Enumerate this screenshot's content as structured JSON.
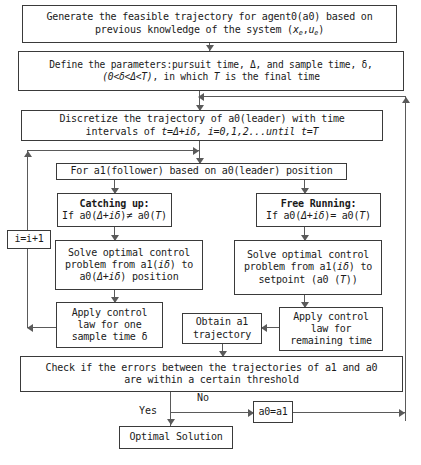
{
  "diagram": {
    "stroke_color": "#3a3a3a",
    "line_color": "#5a5a5a",
    "background_color": "#ffffff",
    "nodes": {
      "generate": {
        "line1": "Generate the feasible trajectory for agent0(a0) based on",
        "line2_pre": "previous knowledge of the system (",
        "line2_x": "x",
        "line2_xsub": "e",
        "line2_mid": ",",
        "line2_u": "u",
        "line2_usub": "e",
        "line2_post": ")"
      },
      "define": {
        "line1": "Define the parameters:pursuit time, Δ, and sample time, δ,",
        "line2_a": "(0<δ<Δ<T)",
        "line2_b": ", in which ",
        "line2_c": "T",
        "line2_d": " is the final time"
      },
      "discretize": {
        "line1": "Discretize the trajectory of a0(leader) with time",
        "line2_a": "intervals of ",
        "line2_b": "t=Δ+iδ,  i=0,1,2...",
        "line2_c": "until",
        "line2_d": " t=T"
      },
      "for_a1": {
        "text": "For a1(follower) based on a0(leader) position"
      },
      "catching_up": {
        "title": "Catching up:",
        "condition_pre": "If  a0(",
        "condition_it": "Δ+iδ",
        "condition_mid": ")≠ a0(",
        "condition_t": "T",
        "condition_post": ")"
      },
      "free_running": {
        "title": "Free Running:",
        "condition_pre": "If  a0(",
        "condition_it": "Δ+iδ",
        "condition_mid": ")= a0(",
        "condition_t": "T",
        "condition_post": ")"
      },
      "solve_left": {
        "line1": "Solve optimal control",
        "line2_a": "problem from a1(",
        "line2_b": "iδ",
        "line2_c": ") to",
        "line3_a": "a0(",
        "line3_b": "Δ+iδ",
        "line3_c": ") position"
      },
      "solve_right": {
        "line1": "Solve optimal control",
        "line2_a": "problem from a1(",
        "line2_b": "iδ",
        "line2_c": ") to",
        "line3_a": "setpoint (a0 (",
        "line3_b": "T",
        "line3_c": "))"
      },
      "apply_left": {
        "line1": "Apply control",
        "line2": "law for one",
        "line3": "sample time δ"
      },
      "apply_right": {
        "line1": "Apply control",
        "line2": "law for",
        "line3": "remaining time"
      },
      "obtain": {
        "line1": "Obtain a1",
        "line2": "trajectory"
      },
      "check": {
        "line1": "Check if the errors between the trajectories of a1 and a0",
        "line2": "are within a certain threshold"
      },
      "increment": {
        "text": "i=i+1"
      },
      "reassign": {
        "text": "a0=a1"
      },
      "optimal": {
        "text": "Optimal Solution"
      }
    },
    "edge_labels": {
      "yes": "Yes",
      "no": "No"
    }
  }
}
